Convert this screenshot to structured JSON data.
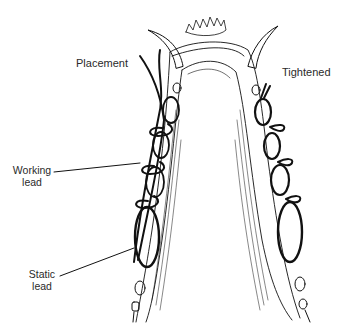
{
  "diagram": {
    "labels": {
      "placement": "Placement",
      "tightened": "Tightened",
      "working_lead_line1": "Working",
      "working_lead_line2": "lead",
      "static_lead_line1": "Static",
      "static_lead_line2": "lead"
    },
    "colors": {
      "ink": "#111111",
      "text": "#2a2a2a",
      "background": "#ffffff"
    }
  }
}
